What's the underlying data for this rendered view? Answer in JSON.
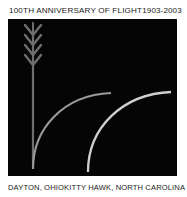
{
  "emblem": {
    "header": {
      "title": "100TH ANNIVERSARY OF FLIGHT",
      "years": "1903-2003"
    },
    "footer": {
      "left_caption": "DAYTON, OHIO",
      "right_caption": "KITTY HAWK, NORTH CAROLINA"
    },
    "panel": {
      "background_color": "#050505",
      "graphics": {
        "wheat_stalk": {
          "name": "wheat-stalk",
          "color": "#6e6e6e",
          "leaf_tiers": 4,
          "stem_top_y": 8,
          "stem_bottom_y": 147
        },
        "arcs": [
          {
            "name": "flight-arc-inner",
            "color": "#9a9a9a",
            "start_x": 25,
            "start_y": 150,
            "end_x": 103,
            "end_y": 74
          },
          {
            "name": "flight-arc-outer",
            "color": "#cfcfcf",
            "start_x": 80,
            "start_y": 153,
            "end_x": 163,
            "end_y": 73
          }
        ]
      }
    },
    "colors": {
      "page_background": "#ffffff",
      "text": "#1b1b1b",
      "panel": "#050505",
      "wheat": "#6e6e6e",
      "arc_inner": "#9a9a9a",
      "arc_outer": "#cfcfcf"
    }
  }
}
